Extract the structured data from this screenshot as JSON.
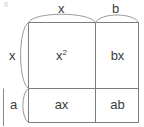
{
  "figure": {
    "name": "area-model-binomial-product",
    "top_labels": [
      {
        "id": "top-x",
        "text": "x"
      },
      {
        "id": "top-b",
        "text": "b"
      }
    ],
    "side_labels": [
      {
        "id": "side-x",
        "text": "x"
      },
      {
        "id": "side-a",
        "text": "a"
      }
    ],
    "cells": [
      {
        "id": "cell-x-squared",
        "base": "x",
        "exponent": "2"
      },
      {
        "id": "cell-bx",
        "text": "bx"
      },
      {
        "id": "cell-ax",
        "text": "ax"
      },
      {
        "id": "cell-ab",
        "text": "ab"
      }
    ],
    "colors": {
      "stroke": "#7d7d7d",
      "brace": "#9a9a9a",
      "text": "#3b3b3b",
      "background": "#ffffff"
    }
  }
}
